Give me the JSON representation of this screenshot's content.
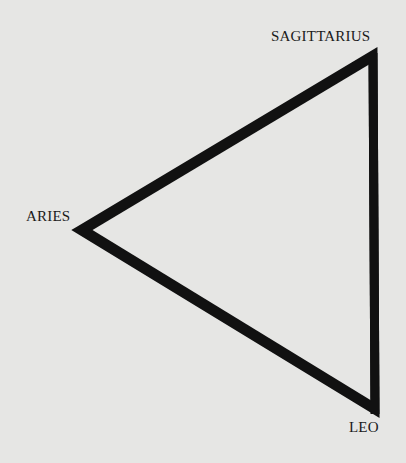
{
  "diagram": {
    "title": "",
    "shape": "triangle",
    "colors": {
      "background": "#e6e6e4",
      "stroke": "#111111",
      "text": "#1a1a1a"
    },
    "vertices": [
      {
        "id": "sagittarius",
        "label": "SAGITTARIUS"
      },
      {
        "id": "aries",
        "label": "ARIES"
      },
      {
        "id": "leo",
        "label": "LEO"
      }
    ],
    "edges": [
      {
        "from": "aries",
        "to": "sagittarius"
      },
      {
        "from": "sagittarius",
        "to": "leo"
      },
      {
        "from": "leo",
        "to": "aries"
      }
    ]
  }
}
